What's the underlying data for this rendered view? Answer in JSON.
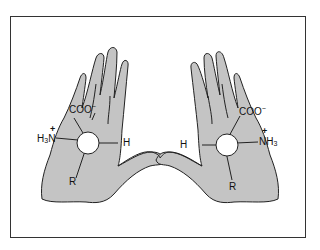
{
  "diagram": {
    "colors": {
      "hand_fill": "#c4c4c4",
      "outline": "#222222",
      "frame": "#333333",
      "background": "#ffffff"
    },
    "left_hand": {
      "carboxylate": {
        "main": "COO",
        "charge": "−"
      },
      "amino": {
        "h": "H",
        "sub": "3",
        "n": "N",
        "charge": "+"
      },
      "hydrogen": "H",
      "side_chain": "R"
    },
    "right_hand": {
      "carboxylate": {
        "main": "COO",
        "charge": "−"
      },
      "amino": {
        "n": "N",
        "h": "H",
        "sub": "3",
        "charge": "+"
      },
      "hydrogen": "H",
      "side_chain": "R"
    }
  }
}
